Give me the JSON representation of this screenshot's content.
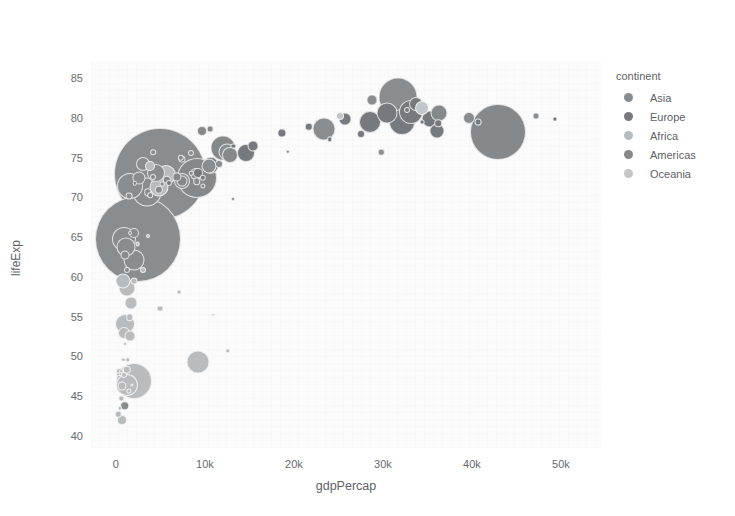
{
  "modebar": {
    "buttons": [
      {
        "name": "download-plot-as-png-button",
        "icon": "camera-icon",
        "label": "Download plot as a png",
        "active": false
      },
      {
        "name": "zoom-button",
        "icon": "magnifier-icon",
        "label": "Zoom",
        "active": true
      },
      {
        "name": "pan-button",
        "icon": "crosshair-move-icon",
        "label": "Pan",
        "active": false
      },
      {
        "name": "box-select-button",
        "icon": "dashed-square-icon",
        "label": "Box Select",
        "active": false
      },
      {
        "name": "lasso-select-button",
        "icon": "lasso-icon",
        "label": "Lasso Select",
        "active": false
      },
      {
        "name": "zoom-in-button",
        "icon": "plus-square-icon",
        "label": "Zoom in",
        "active": false
      },
      {
        "name": "zoom-out-button",
        "icon": "minus-square-icon",
        "label": "Zoom out",
        "active": false
      },
      {
        "name": "autoscale-button",
        "icon": "autoscale-icon",
        "label": "Autoscale",
        "active": false
      },
      {
        "name": "reset-axes-button",
        "icon": "home-icon",
        "label": "Reset axes",
        "active": false
      },
      {
        "name": "toggle-spike-lines-button",
        "icon": "spike-lines-icon",
        "label": "Toggle Spike Lines",
        "active": false
      },
      {
        "name": "hover-closest-button",
        "icon": "hover-closest-icon",
        "label": "Show closest data on hover",
        "active": false
      },
      {
        "name": "hover-compare-button",
        "icon": "hover-compare-icon",
        "label": "Compare data on hover",
        "active": false
      },
      {
        "name": "plotly-logo-button",
        "icon": "plotly-logo-icon",
        "label": "Produced with Plotly",
        "active": true
      }
    ]
  },
  "legend": {
    "title": "continent",
    "items": [
      {
        "label": "Asia",
        "color": "#8a8d90"
      },
      {
        "label": "Europe",
        "color": "#767a7e"
      },
      {
        "label": "Africa",
        "color": "#b9bcbe"
      },
      {
        "label": "Americas",
        "color": "#86898c"
      },
      {
        "label": "Oceania",
        "color": "#c3c6c8"
      }
    ]
  },
  "chart_data": {
    "type": "scatter",
    "title": "",
    "xlabel": "gdpPercap",
    "ylabel": "lifeExp",
    "xlim": [
      -2800,
      54500
    ],
    "ylim": [
      38.5,
      87.0
    ],
    "grid": false,
    "legend_position": "right",
    "size_encoding": "population",
    "color_encoding": "continent",
    "xticks": [
      {
        "value": 0,
        "label": "0"
      },
      {
        "value": 10000,
        "label": "10k"
      },
      {
        "value": 20000,
        "label": "20k"
      },
      {
        "value": 30000,
        "label": "30k"
      },
      {
        "value": 40000,
        "label": "40k"
      },
      {
        "value": 50000,
        "label": "50k"
      }
    ],
    "yticks": [
      {
        "value": 40,
        "label": "40"
      },
      {
        "value": 45,
        "label": "45"
      },
      {
        "value": 50,
        "label": "50"
      },
      {
        "value": 55,
        "label": "55"
      },
      {
        "value": 60,
        "label": "60"
      },
      {
        "value": 65,
        "label": "65"
      },
      {
        "value": 70,
        "label": "70"
      },
      {
        "value": 75,
        "label": "75"
      },
      {
        "value": 80,
        "label": "80"
      },
      {
        "value": 85,
        "label": "85"
      }
    ],
    "series": [
      {
        "name": "Asia",
        "color": "#8a8d90",
        "points": [
          {
            "x": 4959,
            "y": 72.96,
            "r": 46.0
          },
          {
            "x": 2452,
            "y": 64.7,
            "r": 43.0
          },
          {
            "x": 3541,
            "y": 70.65,
            "r": 14.5
          },
          {
            "x": 1593,
            "y": 71.42,
            "r": 13.0
          },
          {
            "x": 944,
            "y": 64.7,
            "r": 12.0
          },
          {
            "x": 2082,
            "y": 62.07,
            "r": 10.5
          },
          {
            "x": 1091,
            "y": 63.79,
            "r": 9.5
          },
          {
            "x": 31656,
            "y": 82.6,
            "r": 19.5
          },
          {
            "x": 23348,
            "y": 78.62,
            "r": 11.5
          },
          {
            "x": 4471,
            "y": 73.0,
            "r": 9.0
          },
          {
            "x": 12452,
            "y": 75.64,
            "r": 8.5
          },
          {
            "x": 7458,
            "y": 71.99,
            "r": 8.0
          },
          {
            "x": 10461,
            "y": 73.92,
            "r": 7.5
          },
          {
            "x": 3095,
            "y": 74.24,
            "r": 7.0
          },
          {
            "x": 39725,
            "y": 79.97,
            "r": 6.0
          },
          {
            "x": 28718,
            "y": 82.21,
            "r": 5.5
          },
          {
            "x": 47143,
            "y": 80.2,
            "r": 3.5
          },
          {
            "x": 2605,
            "y": 72.4,
            "r": 6.5
          },
          {
            "x": 2014,
            "y": 65.53,
            "r": 5.0
          },
          {
            "x": 1056,
            "y": 62.7,
            "r": 4.5
          },
          {
            "x": 11605,
            "y": 74.14,
            "r": 4.0
          },
          {
            "x": 4811,
            "y": 70.96,
            "r": 4.2
          },
          {
            "x": 9065,
            "y": 71.99,
            "r": 3.8
          },
          {
            "x": 29796,
            "y": 75.64,
            "r": 3.2
          },
          {
            "x": 8458,
            "y": 75.54,
            "r": 3.0
          },
          {
            "x": 974,
            "y": 43.83,
            "r": 4.8
          },
          {
            "x": 1441,
            "y": 70.2,
            "r": 3.4
          },
          {
            "x": 4184,
            "y": 75.64,
            "r": 2.8
          }
        ]
      },
      {
        "name": "Europe",
        "color": "#767a7e",
        "points": [
          {
            "x": 32170,
            "y": 79.41,
            "r": 13.0
          },
          {
            "x": 33203,
            "y": 80.66,
            "r": 12.0
          },
          {
            "x": 28569,
            "y": 79.44,
            "r": 11.0
          },
          {
            "x": 30470,
            "y": 80.55,
            "r": 10.5
          },
          {
            "x": 35278,
            "y": 79.83,
            "r": 8.5
          },
          {
            "x": 36126,
            "y": 78.33,
            "r": 7.5
          },
          {
            "x": 33693,
            "y": 81.76,
            "r": 7.0
          },
          {
            "x": 25768,
            "y": 79.78,
            "r": 6.5
          },
          {
            "x": 14619,
            "y": 75.56,
            "r": 9.0
          },
          {
            "x": 10681,
            "y": 74.0,
            "r": 8.2
          },
          {
            "x": 15390,
            "y": 76.49,
            "r": 5.5
          },
          {
            "x": 9253,
            "y": 73.01,
            "r": 5.0
          },
          {
            "x": 18678,
            "y": 78.1,
            "r": 4.6
          },
          {
            "x": 21655,
            "y": 78.89,
            "r": 4.2
          },
          {
            "x": 36180,
            "y": 79.31,
            "r": 3.8
          },
          {
            "x": 40676,
            "y": 79.44,
            "r": 3.4
          },
          {
            "x": 49357,
            "y": 79.83,
            "r": 2.6
          },
          {
            "x": 7446,
            "y": 74.85,
            "r": 3.6
          },
          {
            "x": 5937,
            "y": 71.78,
            "r": 3.0
          },
          {
            "x": 9786,
            "y": 72.48,
            "r": 3.2
          },
          {
            "x": 27538,
            "y": 77.93,
            "r": 4.0
          },
          {
            "x": 32735,
            "y": 80.94,
            "r": 3.0
          },
          {
            "x": 24019,
            "y": 77.29,
            "r": 2.8
          },
          {
            "x": 34435,
            "y": 79.43,
            "r": 2.4
          },
          {
            "x": 13206,
            "y": 76.42,
            "r": 2.6
          },
          {
            "x": 2100,
            "y": 71.78,
            "r": 2.2
          }
        ]
      },
      {
        "name": "Africa",
        "color": "#b9bcbe",
        "points": [
          {
            "x": 2014,
            "y": 46.86,
            "r": 18.0
          },
          {
            "x": 1271,
            "y": 46.46,
            "r": 11.0
          },
          {
            "x": 5581,
            "y": 72.8,
            "r": 10.0
          },
          {
            "x": 4797,
            "y": 71.34,
            "r": 9.5
          },
          {
            "x": 9270,
            "y": 49.34,
            "r": 11.5
          },
          {
            "x": 1044,
            "y": 54.11,
            "r": 10.0
          },
          {
            "x": 1217,
            "y": 58.56,
            "r": 8.5
          },
          {
            "x": 823,
            "y": 59.45,
            "r": 7.5
          },
          {
            "x": 1713,
            "y": 56.73,
            "r": 6.5
          },
          {
            "x": 863,
            "y": 52.95,
            "r": 6.0
          },
          {
            "x": 1598,
            "y": 52.52,
            "r": 5.5
          },
          {
            "x": 3820,
            "y": 73.92,
            "r": 5.0
          },
          {
            "x": 706,
            "y": 42.08,
            "r": 5.0
          },
          {
            "x": 641,
            "y": 46.24,
            "r": 4.5
          },
          {
            "x": 1217,
            "y": 48.3,
            "r": 4.2
          },
          {
            "x": 1569,
            "y": 54.93,
            "r": 3.8
          },
          {
            "x": 430,
            "y": 47.99,
            "r": 4.0
          },
          {
            "x": 2042,
            "y": 59.44,
            "r": 3.5
          },
          {
            "x": 4959,
            "y": 56.01,
            "r": 3.4
          },
          {
            "x": 3071,
            "y": 60.92,
            "r": 3.0
          },
          {
            "x": 12570,
            "y": 50.73,
            "r": 2.8
          },
          {
            "x": 277,
            "y": 42.73,
            "r": 3.2
          },
          {
            "x": 926,
            "y": 47.62,
            "r": 3.0
          },
          {
            "x": 1327,
            "y": 49.58,
            "r": 2.8
          },
          {
            "x": 619,
            "y": 44.74,
            "r": 2.6
          },
          {
            "x": 7093,
            "y": 58.04,
            "r": 2.4
          },
          {
            "x": 1491,
            "y": 45.68,
            "r": 2.6
          },
          {
            "x": 2441,
            "y": 64.16,
            "r": 2.4
          },
          {
            "x": 469,
            "y": 43.49,
            "r": 2.2
          },
          {
            "x": 823,
            "y": 49.57,
            "r": 2.2
          },
          {
            "x": 1056,
            "y": 51.58,
            "r": 2.0
          },
          {
            "x": 3632,
            "y": 65.15,
            "r": 2.0
          },
          {
            "x": 10957,
            "y": 55.24,
            "r": 1.8
          },
          {
            "x": 241,
            "y": 47.75,
            "r": 1.8
          },
          {
            "x": 579,
            "y": 48.16,
            "r": 1.8
          },
          {
            "x": 1803,
            "y": 46.39,
            "r": 1.6
          }
        ]
      },
      {
        "name": "Americas",
        "color": "#86898c",
        "points": [
          {
            "x": 42952,
            "y": 78.24,
            "r": 28.0
          },
          {
            "x": 9066,
            "y": 72.39,
            "r": 20.0
          },
          {
            "x": 11978,
            "y": 76.2,
            "r": 12.5
          },
          {
            "x": 12779,
            "y": 75.32,
            "r": 8.0
          },
          {
            "x": 36319,
            "y": 80.65,
            "r": 8.5
          },
          {
            "x": 8948,
            "y": 72.89,
            "r": 6.0
          },
          {
            "x": 7408,
            "y": 71.99,
            "r": 5.5
          },
          {
            "x": 9645,
            "y": 78.27,
            "r": 5.0
          },
          {
            "x": 6873,
            "y": 72.57,
            "r": 4.6
          },
          {
            "x": 5728,
            "y": 72.23,
            "r": 4.2
          },
          {
            "x": 3548,
            "y": 70.65,
            "r": 3.8
          },
          {
            "x": 10611,
            "y": 78.55,
            "r": 3.4
          },
          {
            "x": 4172,
            "y": 72.57,
            "r": 3.0
          },
          {
            "x": 7320,
            "y": 74.99,
            "r": 3.2
          },
          {
            "x": 1202,
            "y": 60.92,
            "r": 3.0
          },
          {
            "x": 3822,
            "y": 70.26,
            "r": 2.8
          },
          {
            "x": 9809,
            "y": 71.42,
            "r": 2.6
          },
          {
            "x": 5186,
            "y": 71.69,
            "r": 2.4
          },
          {
            "x": 19329,
            "y": 75.7,
            "r": 2.2
          },
          {
            "x": 8458,
            "y": 73.0,
            "r": 2.2
          },
          {
            "x": 1544,
            "y": 65.55,
            "r": 2.0
          },
          {
            "x": 13172,
            "y": 69.82,
            "r": 2.0
          }
        ]
      },
      {
        "name": "Oceania",
        "color": "#c3c6c8",
        "points": [
          {
            "x": 34435,
            "y": 81.24,
            "r": 7.0
          },
          {
            "x": 25185,
            "y": 80.2,
            "r": 4.0
          }
        ]
      }
    ]
  }
}
